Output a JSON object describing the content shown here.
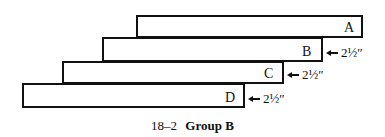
{
  "figure": {
    "caption_number": "18–2",
    "caption_title": "Group B"
  },
  "boards": [
    {
      "label": "A",
      "measurement": ""
    },
    {
      "label": "B",
      "measurement": "2½″"
    },
    {
      "label": "C",
      "measurement": "2½″"
    },
    {
      "label": "D",
      "measurement": "2½″"
    }
  ]
}
